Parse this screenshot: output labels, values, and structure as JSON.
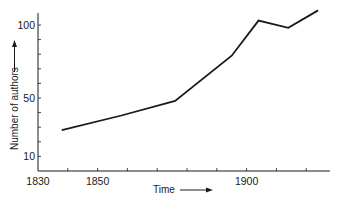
{
  "chart_data": {
    "type": "line",
    "title": "",
    "xlabel": "Time",
    "ylabel": "Number of authors",
    "x": [
      1838,
      1858,
      1876,
      1895,
      1904,
      1914,
      1924
    ],
    "series": [
      {
        "name": "Number of authors",
        "values": [
          28,
          38,
          48,
          79,
          103,
          98,
          110
        ]
      }
    ],
    "xlim": [
      1830,
      1928
    ],
    "ylim": [
      0,
      108
    ],
    "x_ticks": [
      1830,
      1840,
      1850,
      1860,
      1870,
      1880,
      1890,
      1900,
      1910,
      1920
    ],
    "x_tick_labels": [
      "1830",
      "1850",
      "1900"
    ],
    "x_tick_label_values": [
      1830,
      1850,
      1900
    ],
    "y_ticks": [
      10,
      20,
      30,
      40,
      50,
      60,
      70,
      80,
      90,
      100
    ],
    "y_tick_labels": [
      "10",
      "50",
      "100"
    ],
    "y_tick_label_values": [
      10,
      50,
      100
    ],
    "grid": false,
    "legend": "none",
    "line_color": "#1a1a1a"
  }
}
